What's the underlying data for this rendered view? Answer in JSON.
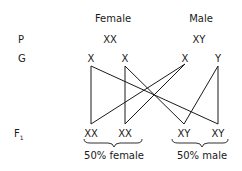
{
  "headers": {
    "female": "Female",
    "male": "Male"
  },
  "rows": {
    "parents": {
      "label": "P",
      "female_genotype": "XX",
      "male_genotype": "XY"
    },
    "gametes": {
      "label": "G",
      "items": [
        "X",
        "X",
        "X",
        "Y"
      ]
    },
    "offspring": {
      "label_main": "F",
      "label_sub": "1",
      "items": [
        "XX",
        "XX",
        "XY",
        "XY"
      ]
    }
  },
  "summary": {
    "female": "50% female",
    "male": "50% male"
  },
  "crosses": [
    {
      "from": "gamete-0",
      "to": "offspring-0"
    },
    {
      "from": "gamete-0",
      "to": "offspring-3"
    },
    {
      "from": "gamete-1",
      "to": "offspring-1"
    },
    {
      "from": "gamete-1",
      "to": "offspring-2"
    },
    {
      "from": "gamete-2",
      "to": "offspring-0"
    },
    {
      "from": "gamete-2",
      "to": "offspring-1"
    },
    {
      "from": "gamete-3",
      "to": "offspring-2"
    },
    {
      "from": "gamete-3",
      "to": "offspring-3"
    }
  ]
}
